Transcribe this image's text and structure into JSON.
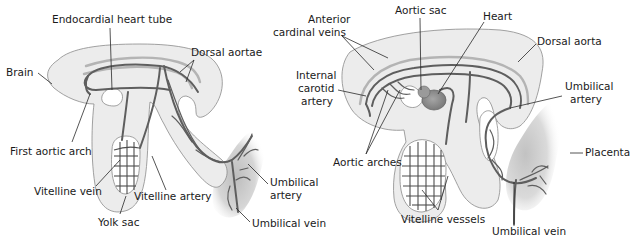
{
  "figure": {
    "left_embryo": {
      "labels": {
        "endocardial_heart_tube": "Endocardial heart tube",
        "dorsal_aortae": "Dorsal aortae",
        "brain": "Brain",
        "first_aortic_arch": "First aortic arch",
        "vitelline_vein": "Vitelline vein",
        "vitelline_artery": "Vitelline artery",
        "yolk_sac": "Yolk sac",
        "umbilical_artery_line1": "Umbilical",
        "umbilical_artery_line2": "artery",
        "umbilical_vein": "Umbilical vein"
      }
    },
    "right_embryo": {
      "labels": {
        "aortic_sac": "Aortic sac",
        "heart": "Heart",
        "anterior_cardinal_veins_line1": "Anterior",
        "anterior_cardinal_veins_line2": "cardinal veins",
        "dorsal_aorta": "Dorsal aorta",
        "internal_carotid_line1": "Internal",
        "internal_carotid_line2": "carotid",
        "internal_carotid_line3": "artery",
        "umbilical_artery_line1": "Umbilical",
        "umbilical_artery_line2": "artery",
        "aortic_arches": "Aortic arches",
        "placenta": "Placenta",
        "vitelline_vessels": "Vitelline vessels",
        "umbilical_vein": "Umbilical vein"
      }
    },
    "colors": {
      "embryo_fill": "#ececec",
      "vessel_dark": "#5e5e5e",
      "vessel_light": "#b4b4b4",
      "heart_fill": "#8c8c8c",
      "placenta_shade": "#c8c8c8",
      "label_text": "#1a1a1a"
    }
  }
}
